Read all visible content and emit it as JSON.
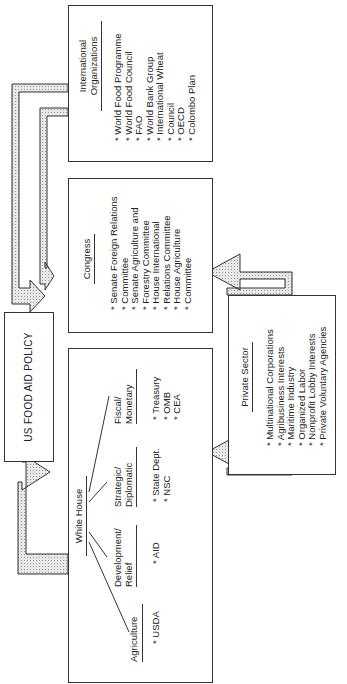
{
  "diagram": {
    "policy_box": {
      "label": "US FOOD AID POLICY"
    },
    "international": {
      "title_lines": [
        "International",
        "Organizations"
      ],
      "items": [
        "World Food Programme",
        "World Food Council",
        "FAO",
        "World Bank Group",
        "International Wheat",
        "Council",
        "OECD",
        "Colombo Plan"
      ]
    },
    "congress": {
      "title": "Congress",
      "items": [
        "Senate Foreign Relations",
        "Committee",
        "Senate Agriculture and",
        "Forestry Committee",
        "House International",
        "Relations Committee",
        "House Agriculture",
        "Committee"
      ]
    },
    "white_house": {
      "title": "White House",
      "groups": [
        {
          "label_lines": [
            "Agriculture"
          ],
          "items": [
            "USDA"
          ]
        },
        {
          "label_lines": [
            "Development/",
            "Relief"
          ],
          "items": [
            "AID"
          ]
        },
        {
          "label_lines": [
            "Strategic/",
            "Diplomatic"
          ],
          "items": [
            "State Dept.",
            "NSC"
          ]
        },
        {
          "label_lines": [
            "Fiscal/",
            "Monetary"
          ],
          "items": [
            "Treasury",
            "OMB",
            "CEA"
          ]
        }
      ]
    },
    "private_sector": {
      "title": "Private Sector",
      "items": [
        "Multinational Corporations",
        "Agribusiness Interests",
        "Maritime Industry",
        "Organized Labor",
        "Nonprofit Lobby Interests",
        "Private Voluntary Agencies"
      ]
    },
    "colors": {
      "arrow_fill": "#d9d9d9",
      "stroke": "#333333"
    }
  }
}
